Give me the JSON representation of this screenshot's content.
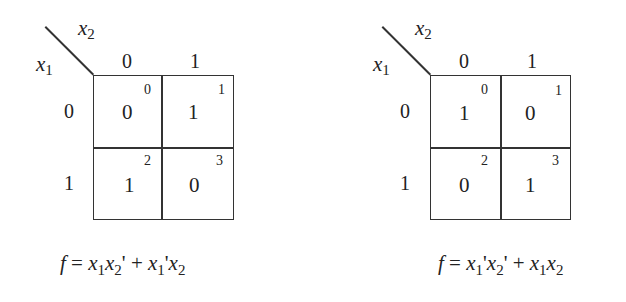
{
  "maps": [
    {
      "row_var": "x",
      "row_var_sub": "1",
      "col_var": "x",
      "col_var_sub": "2",
      "col_headers": [
        "0",
        "1"
      ],
      "row_headers": [
        "0",
        "1"
      ],
      "cells": [
        {
          "value": "0",
          "index": "0"
        },
        {
          "value": "1",
          "index": "1"
        },
        {
          "value": "1",
          "index": "2"
        },
        {
          "value": "0",
          "index": "3"
        }
      ],
      "formula": {
        "lhs": "f",
        "eq": " = ",
        "terms": [
          {
            "a": "x",
            "a_sub": "1",
            "a_prime": "",
            "b": "x",
            "b_sub": "2",
            "b_prime": "'"
          },
          {
            "a": "x",
            "a_sub": "1",
            "a_prime": "'",
            "b": "x",
            "b_sub": "2",
            "b_prime": ""
          }
        ],
        "plus": " + "
      }
    },
    {
      "row_var": "x",
      "row_var_sub": "1",
      "col_var": "x",
      "col_var_sub": "2",
      "col_headers": [
        "0",
        "1"
      ],
      "row_headers": [
        "0",
        "1"
      ],
      "cells": [
        {
          "value": "1",
          "index": "0"
        },
        {
          "value": "0",
          "index": "1"
        },
        {
          "value": "0",
          "index": "2"
        },
        {
          "value": "1",
          "index": "3"
        }
      ],
      "formula": {
        "lhs": "f",
        "eq": " = ",
        "terms": [
          {
            "a": "x",
            "a_sub": "1",
            "a_prime": "'",
            "b": "x",
            "b_sub": "2",
            "b_prime": "'"
          },
          {
            "a": "x",
            "a_sub": "1",
            "a_prime": "",
            "b": "x",
            "b_sub": "2",
            "b_prime": ""
          }
        ],
        "plus": " + "
      }
    }
  ]
}
